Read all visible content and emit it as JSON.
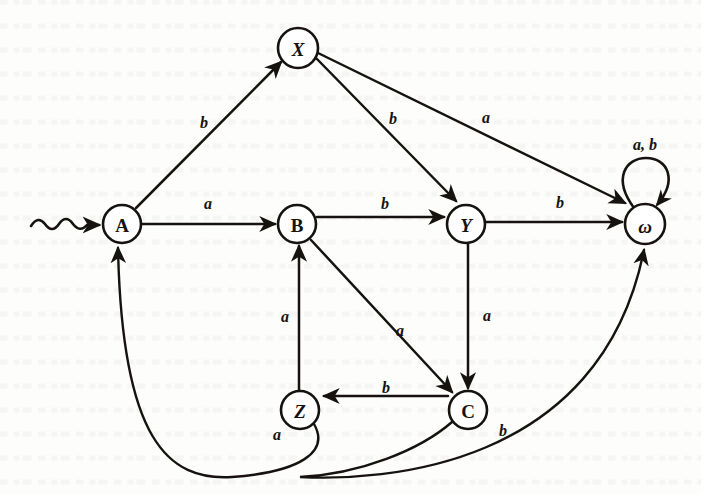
{
  "figure": {
    "kind": "state-transition-diagram",
    "alphabet": [
      "a",
      "b"
    ],
    "ink_color": "#15120f",
    "paper_color": "#fdfdfc"
  },
  "states": [
    {
      "id": "A",
      "label": "A",
      "cx": 122,
      "cy": 224,
      "r": 19,
      "italic": false,
      "start": true
    },
    {
      "id": "B",
      "label": "B",
      "cx": 297,
      "cy": 224,
      "r": 19,
      "italic": false,
      "start": false
    },
    {
      "id": "X",
      "label": "X",
      "cx": 298,
      "cy": 48,
      "r": 20,
      "italic": true,
      "start": false
    },
    {
      "id": "Y",
      "label": "Y",
      "cx": 466,
      "cy": 224,
      "r": 19,
      "italic": true,
      "start": false
    },
    {
      "id": "Z",
      "label": "Z",
      "cx": 300,
      "cy": 410,
      "r": 19,
      "italic": true,
      "start": false
    },
    {
      "id": "C",
      "label": "C",
      "cx": 468,
      "cy": 410,
      "r": 19,
      "italic": false,
      "start": false
    },
    {
      "id": "W",
      "label": "ω",
      "cx": 645,
      "cy": 224,
      "r": 20,
      "italic": true,
      "start": false
    }
  ],
  "transitions": [
    {
      "id": "A-X",
      "from": "A",
      "to": "X",
      "symbol": "b",
      "label_x": 204,
      "label_y": 122
    },
    {
      "id": "A-B",
      "from": "A",
      "to": "B",
      "symbol": "a",
      "label_x": 208,
      "label_y": 203
    },
    {
      "id": "X-Y",
      "from": "X",
      "to": "Y",
      "symbol": "b",
      "label_x": 393,
      "label_y": 118
    },
    {
      "id": "X-W",
      "from": "X",
      "to": "W",
      "symbol": "a",
      "label_x": 486,
      "label_y": 117
    },
    {
      "id": "B-Y",
      "from": "B",
      "to": "Y",
      "symbol": "b",
      "label_x": 385,
      "label_y": 203
    },
    {
      "id": "B-C",
      "from": "B",
      "to": "C",
      "symbol": "a",
      "label_x": 400,
      "label_y": 330
    },
    {
      "id": "Y-W",
      "from": "Y",
      "to": "W",
      "symbol": "b",
      "label_x": 560,
      "label_y": 202
    },
    {
      "id": "Y-C",
      "from": "Y",
      "to": "C",
      "symbol": "a",
      "label_x": 487,
      "label_y": 315
    },
    {
      "id": "Z-B",
      "from": "Z",
      "to": "B",
      "symbol": "a",
      "label_x": 285,
      "label_y": 316
    },
    {
      "id": "C-Z",
      "from": "C",
      "to": "Z",
      "symbol": "b",
      "label_x": 386,
      "label_y": 387
    },
    {
      "id": "Z-A",
      "from": "Z",
      "to": "A",
      "symbol": "a",
      "label_x": 277,
      "label_y": 434
    },
    {
      "id": "C-W",
      "from": "C",
      "to": "W",
      "symbol": "b",
      "label_x": 503,
      "label_y": 430
    },
    {
      "id": "W-W",
      "from": "W",
      "to": "W",
      "symbol": "a, b",
      "label_x": 645,
      "label_y": 144
    }
  ],
  "start_marker": {
    "name": "squiggle-start-arrow",
    "target": "A",
    "from_x": 30,
    "to_x": 100,
    "y": 224
  }
}
